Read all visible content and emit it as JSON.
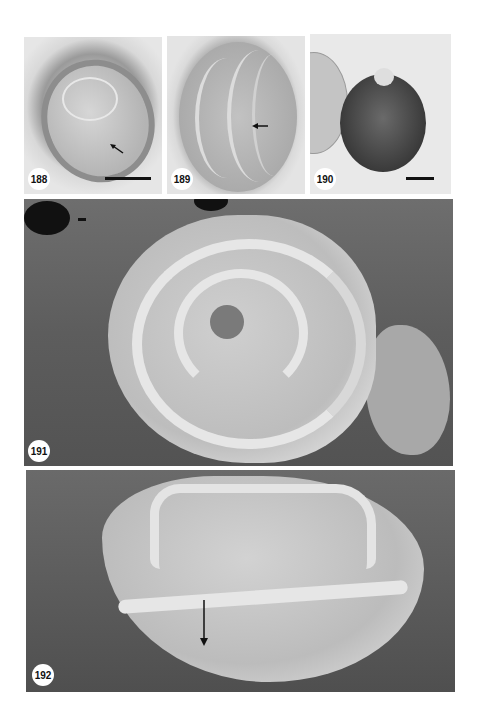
{
  "figure": {
    "type": "micrograph plate",
    "panels": [
      {
        "id": "188",
        "label": "188",
        "kind": "light micrograph",
        "has_scale_bar": true,
        "has_arrow": true
      },
      {
        "id": "189",
        "label": "189",
        "kind": "light micrograph",
        "has_scale_bar": false,
        "has_arrow": true
      },
      {
        "id": "190",
        "label": "190",
        "kind": "light micrograph",
        "has_scale_bar": true,
        "has_arrow": false
      },
      {
        "id": "191",
        "label": "191",
        "kind": "SEM micrograph",
        "has_scale_bar": true,
        "has_arrow": false
      },
      {
        "id": "192",
        "label": "192",
        "kind": "SEM micrograph",
        "has_scale_bar": false,
        "has_arrow": true
      }
    ]
  },
  "colors": {
    "background": "#ffffff",
    "label_bg": "#ffffff",
    "label_text": "#111111",
    "sem_background": "#5d5d5d",
    "grain_light": "#d4d4d4"
  }
}
